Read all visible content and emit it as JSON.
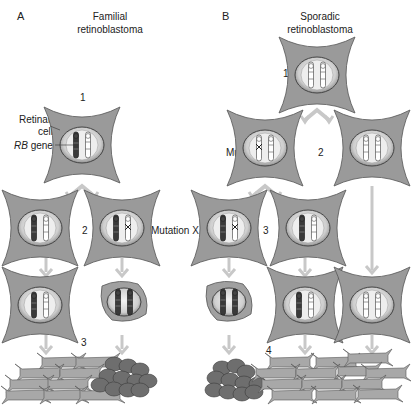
{
  "panels": {
    "a": {
      "letter": "A",
      "title_line1": "Familial",
      "title_line2": "retinoblastoma",
      "steps": [
        "1",
        "2",
        "3"
      ],
      "labels": {
        "retinal_cell": "Retinal",
        "retinal_cell_2": "cell",
        "rb_gene_italic": "RB",
        "rb_gene_rest": " gene",
        "mutation": "Mutation X"
      }
    },
    "b": {
      "letter": "B",
      "title_line1": "Sporadic",
      "title_line2": "retinoblastoma",
      "steps": [
        "1",
        "2",
        "3",
        "4"
      ],
      "labels": {
        "mutation_1": "Mutation X",
        "mutation_2": "Mutation X"
      }
    }
  },
  "colors": {
    "cell_fill": "#9a9a9a",
    "cell_stroke": "#555555",
    "nucleus_fill": "#d9d9d9",
    "arrow": "#c8c8c8",
    "tumor": "#6e6e6e",
    "tissue": "#a8a8a8"
  }
}
